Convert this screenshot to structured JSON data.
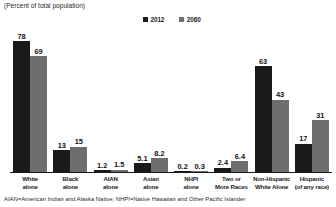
{
  "header": {
    "title": "",
    "subtitle": "(Percent of total population)"
  },
  "legend": [
    {
      "label": "2012",
      "color": "#1a1a1a"
    },
    {
      "label": "2060",
      "color": "#6e6e6e"
    }
  ],
  "footnote": "AIAN=American Indian and Alaska Native; NHPI=Native Hawaiian and Other Pacific Islander",
  "chart_data": {
    "type": "bar",
    "title": "",
    "subtitle": "(Percent of total population)",
    "xlabel": "",
    "ylabel": "",
    "ylim": [
      0,
      80
    ],
    "grid": false,
    "legend_position": "top-center",
    "categories": [
      "White\nalone",
      "Black\nalone",
      "AIAN\nalone",
      "Asian\nalone",
      "NHPI\nalone",
      "Two or\nMore Races",
      "Non-Hispanic\nWhite Alone",
      "Hispanic\n(of any race)"
    ],
    "category_lines": [
      [
        "White",
        "alone"
      ],
      [
        "Black",
        "alone"
      ],
      [
        "AIAN",
        "alone"
      ],
      [
        "Asian",
        "alone"
      ],
      [
        "NHPI",
        "alone"
      ],
      [
        "Two or",
        "More Races"
      ],
      [
        "Non-Hispanic",
        "White Alone"
      ],
      [
        "Hispanic",
        "(of any race)"
      ]
    ],
    "series": [
      {
        "name": "2012",
        "color": "#1a1a1a",
        "values": [
          78,
          13,
          1.2,
          5.1,
          0.2,
          2.4,
          63,
          17
        ]
      },
      {
        "name": "2060",
        "color": "#6e6e6e",
        "values": [
          69,
          15,
          1.5,
          8.2,
          0.3,
          6.4,
          43,
          31
        ]
      }
    ]
  }
}
